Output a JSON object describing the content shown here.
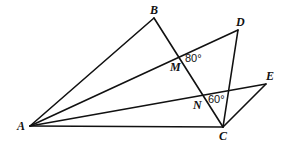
{
  "diagram": {
    "type": "geometry",
    "points": {
      "A": "A",
      "B": "B",
      "C": "C",
      "D": "D",
      "E": "E",
      "M": "M",
      "N": "N"
    },
    "segments": [
      [
        "A",
        "B"
      ],
      [
        "B",
        "C"
      ],
      [
        "A",
        "D"
      ],
      [
        "D",
        "C"
      ],
      [
        "A",
        "E"
      ],
      [
        "E",
        "C"
      ],
      [
        "A",
        "C"
      ]
    ],
    "angles": [
      {
        "at": "M",
        "label": "80°"
      },
      {
        "at": "N",
        "label": "60°"
      }
    ]
  }
}
